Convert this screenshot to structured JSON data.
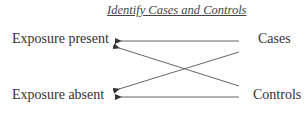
{
  "diagram": {
    "title": "Identify Cases and Controls",
    "left_nodes": [
      {
        "id": "exposure_present",
        "label": "Exposure present"
      },
      {
        "id": "exposure_absent",
        "label": "Exposure absent"
      }
    ],
    "right_nodes": [
      {
        "id": "cases",
        "label": "Cases"
      },
      {
        "id": "controls",
        "label": "Controls"
      }
    ],
    "edges": [
      {
        "from": "cases",
        "to": "exposure_present"
      },
      {
        "from": "cases",
        "to": "exposure_absent"
      },
      {
        "from": "controls",
        "to": "exposure_present"
      },
      {
        "from": "controls",
        "to": "exposure_absent"
      }
    ],
    "colors": {
      "line": "#555555",
      "text": "#333333"
    }
  }
}
